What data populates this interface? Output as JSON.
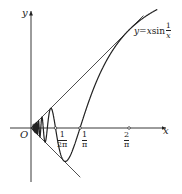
{
  "figure": {
    "origin_px": [
      31,
      128
    ],
    "scale_px_per_unit": 154,
    "axes": {
      "x_label": "x",
      "y_label": "y",
      "origin_label": "O",
      "x_range_px": [
        10,
        166
      ],
      "y_range_px": [
        182,
        11
      ]
    },
    "function_label": {
      "lhs": "y=x",
      "fn": "sin",
      "num": "1",
      "den": "x"
    },
    "ticks": [
      {
        "value": 0.159155,
        "num": "1",
        "den": "2π"
      },
      {
        "value": 0.31831,
        "num": "1",
        "den": "π"
      },
      {
        "value": 0.63662,
        "num": "2",
        "den": "π"
      }
    ],
    "envelope_lines": {
      "upper": {
        "slope": 1,
        "x_end": 0.73
      },
      "lower": {
        "slope": -1,
        "x_end": 0.32
      }
    },
    "curve": {
      "expression": "x*sin(1/x)",
      "x_min": 0.012,
      "x_max": 0.82
    },
    "colors": {
      "stroke": "#222222",
      "background": "#ffffff"
    }
  }
}
